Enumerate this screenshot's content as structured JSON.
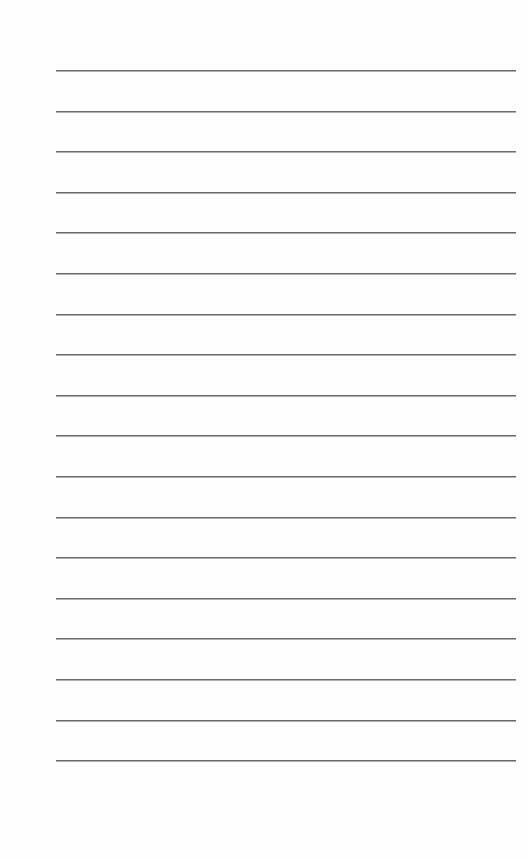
{
  "page": {
    "type": "lined-paper",
    "background_color": "#fefefe",
    "line_color": "#6a6a6a",
    "line_count": 18,
    "line_left_px": 56,
    "line_width_px": 460,
    "first_line_y_px": 70,
    "line_spacing_px": 40.6,
    "text": ""
  }
}
